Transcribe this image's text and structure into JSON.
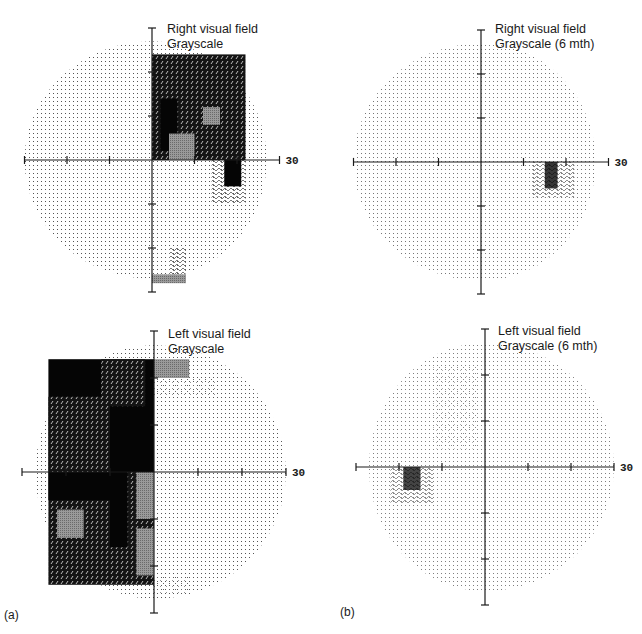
{
  "figure": {
    "panel_letters": [
      "(a)",
      "(b)"
    ]
  },
  "chart_data": [
    {
      "type": "heatmap",
      "id": "right-initial",
      "group": "(a)",
      "title": [
        "Right visual field",
        "Grayscale"
      ],
      "x_tick_label": "30",
      "xlim": [
        -30,
        30
      ],
      "ylim": [
        -30,
        30
      ],
      "tick_step": 10,
      "field_shape": "diamond-ish circle, extends to 30 deg temporal (left), ~27 deg nasal (right)",
      "levels": {
        "0": "normal (fine dots)",
        "1": "mild (sparse dots)",
        "2": "relative (hatched)",
        "3": "moderate (gray)",
        "4": "dense (dark pattern)",
        "5": "absolute (black)"
      },
      "regions": [
        {
          "x": [
            0,
            22
          ],
          "y": [
            0,
            24
          ],
          "level": 4,
          "note": "superior nasal quadrant defect, stepped edge"
        },
        {
          "x": [
            2,
            6
          ],
          "y": [
            2,
            14
          ],
          "level": 5
        },
        {
          "x": [
            4,
            10
          ],
          "y": [
            0,
            6
          ],
          "level": 3
        },
        {
          "x": [
            12,
            16
          ],
          "y": [
            8,
            12
          ],
          "level": 3
        },
        {
          "x": [
            14,
            22
          ],
          "y": [
            -10,
            0
          ],
          "level": 2,
          "note": "blind spot region"
        },
        {
          "x": [
            17,
            21
          ],
          "y": [
            -6,
            0
          ],
          "level": 5
        },
        {
          "x": [
            4,
            8
          ],
          "y": [
            -26,
            -20
          ],
          "level": 2
        },
        {
          "x": [
            0,
            8
          ],
          "y": [
            -28,
            -26
          ],
          "level": 3
        }
      ]
    },
    {
      "type": "heatmap",
      "id": "right-6mth",
      "group": "(b)",
      "title": [
        "Right visual field",
        "Grayscale (6 mth)"
      ],
      "x_tick_label": "30",
      "xlim": [
        -30,
        30
      ],
      "ylim": [
        -30,
        30
      ],
      "tick_step": 10,
      "regions": [
        {
          "x": [
            12,
            22
          ],
          "y": [
            -8,
            0
          ],
          "level": 2,
          "note": "blind spot"
        },
        {
          "x": [
            15,
            18
          ],
          "y": [
            -6,
            0
          ],
          "level": 5
        }
      ]
    },
    {
      "type": "heatmap",
      "id": "left-initial",
      "group": "(a)",
      "title": [
        "Left visual field",
        "Grayscale"
      ],
      "x_tick_label": "30",
      "xlim": [
        -30,
        30
      ],
      "ylim": [
        -30,
        30
      ],
      "tick_step": 10,
      "regions": [
        {
          "x": [
            -24,
            0
          ],
          "y": [
            0,
            24
          ],
          "level": 5,
          "note": "dense superior nasal (left) defect, stepped edge"
        },
        {
          "x": [
            -24,
            -10
          ],
          "y": [
            0,
            16
          ],
          "level": 4
        },
        {
          "x": [
            -12,
            -2
          ],
          "y": [
            14,
            24
          ],
          "level": 4
        },
        {
          "x": [
            -24,
            0
          ],
          "y": [
            -24,
            0
          ],
          "level": 4,
          "note": "inferior nasal defect"
        },
        {
          "x": [
            -24,
            -10
          ],
          "y": [
            -6,
            0
          ],
          "level": 5
        },
        {
          "x": [
            -10,
            -6
          ],
          "y": [
            -16,
            0
          ],
          "level": 5
        },
        {
          "x": [
            -4,
            0
          ],
          "y": [
            -10,
            0
          ],
          "level": 3
        },
        {
          "x": [
            -22,
            -16
          ],
          "y": [
            -14,
            -8
          ],
          "level": 3
        },
        {
          "x": [
            -4,
            0
          ],
          "y": [
            -22,
            -12
          ],
          "level": 3
        },
        {
          "x": [
            0,
            8
          ],
          "y": [
            20,
            24
          ],
          "level": 3
        },
        {
          "x": [
            0,
            14
          ],
          "y": [
            16,
            20
          ],
          "level": 1
        },
        {
          "x": [
            0,
            8
          ],
          "y": [
            -26,
            -22
          ],
          "level": 1
        }
      ]
    },
    {
      "type": "heatmap",
      "id": "left-6mth",
      "group": "(b)",
      "title": [
        "Left visual field",
        "Grayscale (6 mth)"
      ],
      "x_tick_label": "30",
      "xlim": [
        -30,
        30
      ],
      "ylim": [
        -30,
        30
      ],
      "tick_step": 10,
      "regions": [
        {
          "x": [
            -22,
            -12
          ],
          "y": [
            -8,
            0
          ],
          "level": 2,
          "note": "blind spot"
        },
        {
          "x": [
            -19,
            -15
          ],
          "y": [
            -5,
            0
          ],
          "level": 5
        },
        {
          "x": [
            -12,
            -2
          ],
          "y": [
            4,
            22
          ],
          "level": 1
        }
      ]
    }
  ]
}
